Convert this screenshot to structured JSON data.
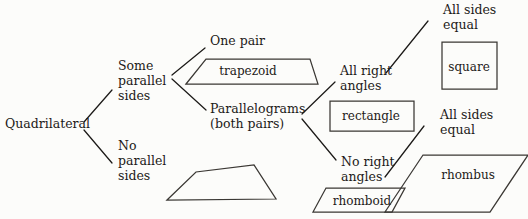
{
  "diagram": {
    "root": {
      "label": "Quadrilateral",
      "x": 5,
      "y": 128
    },
    "branch_labels": [
      {
        "id": "some-parallel-sides",
        "lines": [
          "Some",
          "parallel",
          "sides"
        ],
        "x": 118,
        "y": 70
      },
      {
        "id": "no-parallel-sides",
        "lines": [
          "No",
          "parallel",
          "sides"
        ],
        "x": 118,
        "y": 150
      },
      {
        "id": "one-pair",
        "lines": [
          "One pair"
        ],
        "x": 210,
        "y": 45
      },
      {
        "id": "parallelograms",
        "lines": [
          "Parallelograms",
          "(both pairs)"
        ],
        "x": 210,
        "y": 113
      },
      {
        "id": "all-right-angles",
        "lines": [
          "All right",
          "angles"
        ],
        "x": 340,
        "y": 75
      },
      {
        "id": "no-right-angles",
        "lines": [
          "No right",
          "angles"
        ],
        "x": 341,
        "y": 166
      },
      {
        "id": "all-sides-equal-top",
        "lines": [
          "All sides",
          "equal"
        ],
        "x": 443,
        "y": 14
      },
      {
        "id": "all-sides-equal-bottom",
        "lines": [
          "All sides",
          "equal"
        ],
        "x": 440,
        "y": 119
      }
    ],
    "shapes": [
      {
        "id": "trapezoid",
        "label": "trapezoid",
        "label_x": 248,
        "label_y": 75,
        "points": "186,84 206,59 310,59 318,84"
      },
      {
        "id": "irregular-quadrilateral",
        "label": "",
        "label_x": 0,
        "label_y": 0,
        "points": "167,200 196,172 254,165 276,199"
      },
      {
        "id": "rectangle",
        "label": "rectangle",
        "label_x": 371,
        "label_y": 118,
        "points": "330,101 414,101 414,131 330,131"
      },
      {
        "id": "square",
        "label": "square",
        "label_x": 469,
        "label_y": 72,
        "points": "442,42 497,42 497,89 442,89"
      },
      {
        "id": "rhomboid",
        "label": "rhomboid",
        "label_x": 370,
        "label_y": 204,
        "points": "326,188 405,188 392,212 313,212"
      },
      {
        "id": "rhombus",
        "label": "rhombus",
        "label_x": 468,
        "label_y": 177,
        "points": "423,155 528,155 490,212 385,212"
      }
    ],
    "connectors": [
      {
        "id": "root-to-some-parallel",
        "path": "M84,122 L112,90"
      },
      {
        "id": "root-to-no-parallel",
        "path": "M84,130 L112,163"
      },
      {
        "id": "some-parallel-to-one-pair",
        "path": "M172,75 L205,48"
      },
      {
        "id": "some-parallel-to-parallelograms",
        "path": "M172,79 L206,110"
      },
      {
        "id": "parallelograms-to-all-right",
        "path": "M302,114 L335,82"
      },
      {
        "id": "parallelograms-to-no-right",
        "path": "M302,119 L336,160"
      },
      {
        "id": "all-right-to-all-sides-equal",
        "path": "M386,73 L428,21"
      },
      {
        "id": "no-right-to-all-sides-equal",
        "path": "M385,177 L424,126"
      }
    ],
    "colors": {
      "ink": "#1c1a18",
      "figure_stroke": "#3a3733",
      "background": "#fcfcfa"
    }
  }
}
